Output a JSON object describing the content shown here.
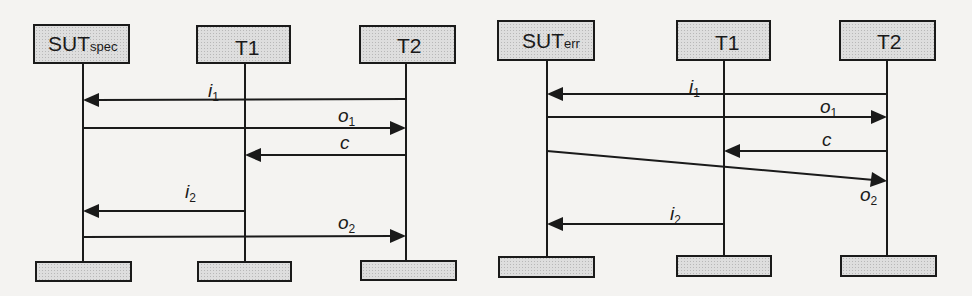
{
  "diagrams": [
    {
      "id": "spec",
      "participants": [
        {
          "name": "SUT",
          "subscript": "spec"
        },
        {
          "name": "T1",
          "subscript": ""
        },
        {
          "name": "T2",
          "subscript": ""
        }
      ],
      "messages": [
        {
          "label": "i",
          "subscript": "1",
          "from": "T2",
          "to": "SUT"
        },
        {
          "label": "o",
          "subscript": "1",
          "from": "SUT",
          "to": "T2"
        },
        {
          "label": "c",
          "subscript": "",
          "from": "T2",
          "to": "T1"
        },
        {
          "label": "i",
          "subscript": "2",
          "from": "T1",
          "to": "SUT"
        },
        {
          "label": "o",
          "subscript": "2",
          "from": "SUT",
          "to": "T2"
        }
      ]
    },
    {
      "id": "err",
      "participants": [
        {
          "name": "SUT",
          "subscript": "err"
        },
        {
          "name": "T1",
          "subscript": ""
        },
        {
          "name": "T2",
          "subscript": ""
        }
      ],
      "messages": [
        {
          "label": "i",
          "subscript": "1",
          "from": "T2",
          "to": "SUT"
        },
        {
          "label": "o",
          "subscript": "1",
          "from": "SUT",
          "to": "T2"
        },
        {
          "label": "c",
          "subscript": "",
          "from": "T2",
          "to": "T1"
        },
        {
          "label": "o",
          "subscript": "2",
          "from": "SUT",
          "to": "T2",
          "note": "delayed / crossing arrow"
        },
        {
          "label": "i",
          "subscript": "2",
          "from": "T1",
          "to": "SUT"
        }
      ]
    }
  ],
  "colors": {
    "line": "#1a1a1a",
    "box_fill": "#d9d9d9",
    "background": "#f4f3f1"
  }
}
